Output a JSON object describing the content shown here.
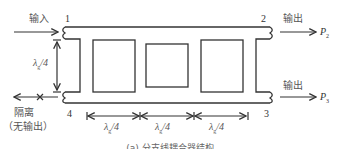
{
  "diagram": {
    "type": "branch-line coupler schematic",
    "ports": {
      "port1": {
        "number": "1",
        "role_label": "输入"
      },
      "port2": {
        "number": "2",
        "role_label": "输出",
        "power": "P",
        "power_sub": "2"
      },
      "port3": {
        "number": "3",
        "role_label": "输出",
        "power": "P",
        "power_sub": "3"
      },
      "port4": {
        "number": "4",
        "role_label": "隔离",
        "note": "（无输出）"
      }
    },
    "dimensions": {
      "vertical": {
        "lambda": "λ",
        "sub": "g",
        "frac": "/4"
      },
      "horizontal": [
        {
          "lambda": "λ",
          "sub": "g",
          "frac": "/4"
        },
        {
          "lambda": "λ",
          "sub": "g",
          "frac": "/4"
        },
        {
          "lambda": "λ",
          "sub": "g",
          "frac": "/4"
        }
      ]
    },
    "caption": "(a) 分支线耦合器结构"
  }
}
